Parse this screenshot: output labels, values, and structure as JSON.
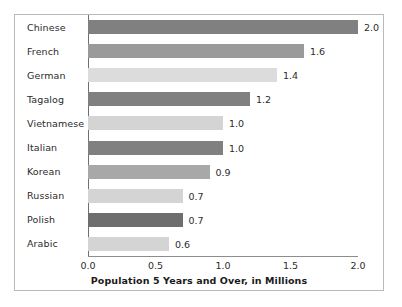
{
  "chart_data": {
    "type": "bar",
    "orientation": "horizontal",
    "title": "",
    "xlabel": "Population 5 Years and Over, in Millions",
    "ylabel": "",
    "categories": [
      "Chinese",
      "French",
      "German",
      "Tagalog",
      "Vietnamese",
      "Italian",
      "Korean",
      "Russian",
      "Polish",
      "Arabic"
    ],
    "values": [
      2.0,
      1.6,
      1.4,
      1.2,
      1.0,
      1.0,
      0.9,
      0.7,
      0.7,
      0.6
    ],
    "value_labels": [
      "2.0",
      "1.6",
      "1.4",
      "1.2",
      "1.0",
      "1.0",
      "0.9",
      "0.7",
      "0.7",
      "0.6"
    ],
    "bar_colors": [
      "#808080",
      "#9a9a9a",
      "#dcdcdc",
      "#808080",
      "#d4d4d4",
      "#808080",
      "#a8a8a8",
      "#d4d4d4",
      "#6e6e6e",
      "#d4d4d4"
    ],
    "xlim": [
      0.0,
      2.0
    ],
    "xticks": [
      0.0,
      0.5,
      1.0,
      1.5,
      2.0
    ],
    "xtick_labels": [
      "0.0",
      "0.5",
      "1.0",
      "1.5",
      "2.0"
    ],
    "grid": false,
    "legend": null
  },
  "frame": {
    "border_color": "#b9b9b9",
    "background": "#ffffff"
  }
}
